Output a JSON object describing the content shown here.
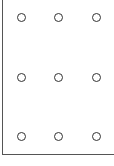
{
  "diagram": {
    "type": "dot-grid",
    "rows": 3,
    "cols": 3,
    "dot_style": "hollow-circle",
    "stroke_color": "#333333",
    "axis_color": "#555555",
    "dots": [
      {
        "row": 0,
        "col": 0,
        "x": 21,
        "y": 17
      },
      {
        "row": 0,
        "col": 1,
        "x": 58,
        "y": 17
      },
      {
        "row": 0,
        "col": 2,
        "x": 96,
        "y": 17
      },
      {
        "row": 1,
        "col": 0,
        "x": 21,
        "y": 77
      },
      {
        "row": 1,
        "col": 1,
        "x": 58,
        "y": 77
      },
      {
        "row": 1,
        "col": 2,
        "x": 96,
        "y": 77
      },
      {
        "row": 2,
        "col": 0,
        "x": 21,
        "y": 136
      },
      {
        "row": 2,
        "col": 1,
        "x": 58,
        "y": 136
      },
      {
        "row": 2,
        "col": 2,
        "x": 96,
        "y": 136
      }
    ]
  }
}
